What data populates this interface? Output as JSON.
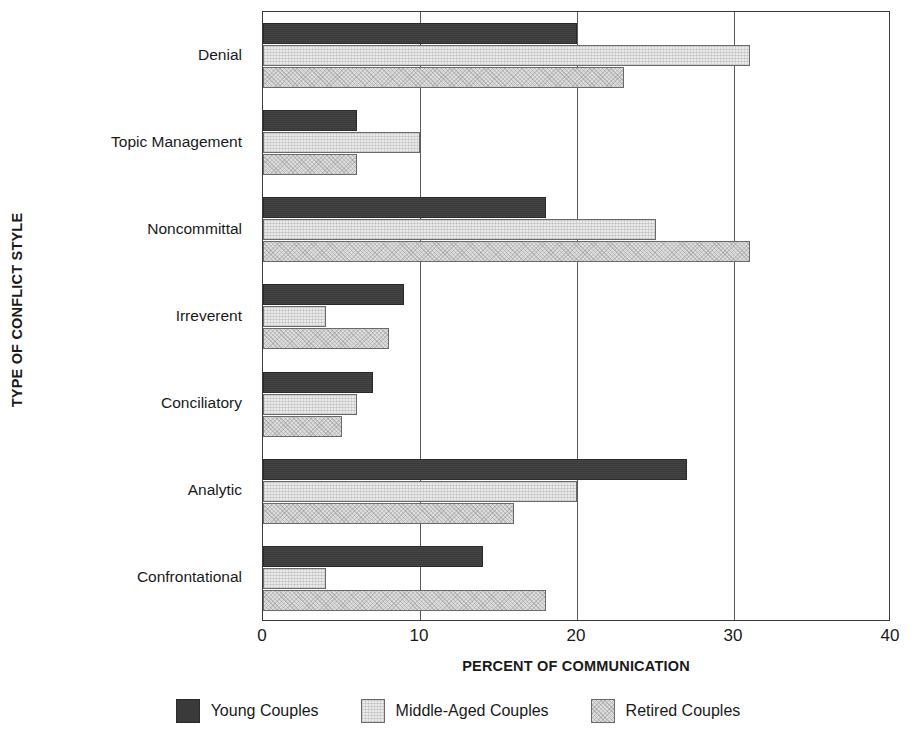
{
  "chart_data": {
    "type": "bar",
    "orientation": "horizontal",
    "title": "",
    "xlabel": "PERCENT OF COMMUNICATION",
    "ylabel": "TYPE OF CONFLICT STYLE",
    "xlim": [
      0,
      40
    ],
    "xticks": [
      0,
      10,
      20,
      30,
      40
    ],
    "xtick_labels": [
      "0",
      "10",
      "20",
      "30",
      "40"
    ],
    "grid": true,
    "grid_axis": "x",
    "legend_position": "bottom",
    "categories": [
      "Denial",
      "Topic Management",
      "Noncommittal",
      "Irreverent",
      "Conciliatory",
      "Analytic",
      "Confrontational"
    ],
    "series": [
      {
        "name": "Young Couples",
        "color": "#3a3a3a",
        "values": [
          20,
          6,
          18,
          9,
          7,
          27,
          14
        ]
      },
      {
        "name": "Middle-Aged Couples",
        "color": "#eaeaea",
        "values": [
          31,
          10,
          25,
          4,
          6,
          20,
          4
        ]
      },
      {
        "name": "Retired Couples",
        "color": "#dcdcdc",
        "values": [
          23,
          6,
          31,
          8,
          5,
          16,
          18
        ]
      }
    ]
  }
}
